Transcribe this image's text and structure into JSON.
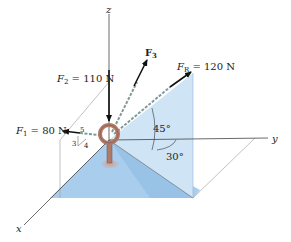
{
  "figure": {
    "axes": {
      "x_label": "x",
      "y_label": "y",
      "z_label": "z"
    },
    "forces": {
      "F1": {
        "symbol": "F",
        "subscript": "1",
        "value_text": " = 80 N"
      },
      "F2": {
        "symbol": "F",
        "subscript": "2",
        "value_text": " = 110 N"
      },
      "F3": {
        "symbol": "F",
        "subscript": "3",
        "value_text": ""
      },
      "FR": {
        "symbol": "F",
        "subscript": "R",
        "value_text": " = 120 N"
      }
    },
    "slope_triangle": {
      "hyp": "5",
      "vertical": "3",
      "horizontal": "4"
    },
    "angles": {
      "elevation": "45°",
      "azimuth": "30°"
    },
    "colors": {
      "plane_light": "#cfe4f5",
      "plane_mid": "#a9cdec",
      "plane_dark": "#8fbde3",
      "chain": "#7f9a9a",
      "eyebolt": "#b07a68",
      "arrow": "#111111",
      "axis": "#444444"
    }
  }
}
